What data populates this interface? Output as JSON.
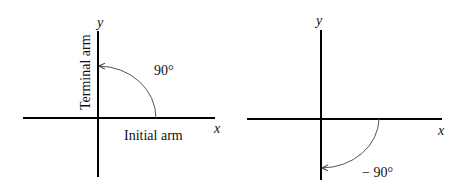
{
  "diagrams": [
    {
      "name": "positive-90-degree-angle",
      "axis_labels": {
        "x": "x",
        "y": "y"
      },
      "angle_label": "90°",
      "terminal_arm_label": "Terminal arm",
      "initial_arm_label": "Initial arm"
    },
    {
      "name": "negative-90-degree-angle",
      "axis_labels": {
        "x": "x",
        "y": "y"
      },
      "angle_label": "− 90°"
    }
  ],
  "colors": {
    "axis": "#000000",
    "arc": "#555555",
    "text": "#111111"
  }
}
